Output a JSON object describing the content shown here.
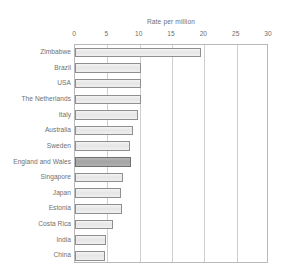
{
  "chart_data": {
    "type": "bar",
    "orientation": "horizontal",
    "title": "",
    "xlabel": "Rate per million",
    "ylabel": "",
    "xlim": [
      0,
      30
    ],
    "xticks": [
      0,
      5,
      10,
      15,
      20,
      25,
      30
    ],
    "xtick_labels": [
      "0",
      "5",
      "10",
      "15",
      "20",
      "25",
      "30"
    ],
    "grid": true,
    "grid_axis": "x",
    "legend": false,
    "categories": [
      "Zimbabwe",
      "Brazil",
      "USA",
      "The Netherlands",
      "Italy",
      "Australia",
      "Sweden",
      "England and Wales",
      "Singapore",
      "Japan",
      "Estonia",
      "Costa Rica",
      "India",
      "China"
    ],
    "values": [
      19.5,
      10.2,
      10.2,
      10.2,
      9.8,
      8.9,
      8.5,
      8.7,
      7.4,
      7.1,
      7.3,
      5.9,
      4.8,
      4.7
    ],
    "highlighted_category": "England and Wales",
    "colors": {
      "bar_fill": "#e9e9e9",
      "bar_border": "#8f8f8f",
      "highlight_fill": "#acacac",
      "highlight_border": "#707070",
      "grid": "#cfcfcf",
      "frame": "#b9b9b9",
      "text": "#6f6f6f"
    }
  },
  "axis": {
    "caption": "Rate per million"
  },
  "title": {
    "text": ""
  }
}
